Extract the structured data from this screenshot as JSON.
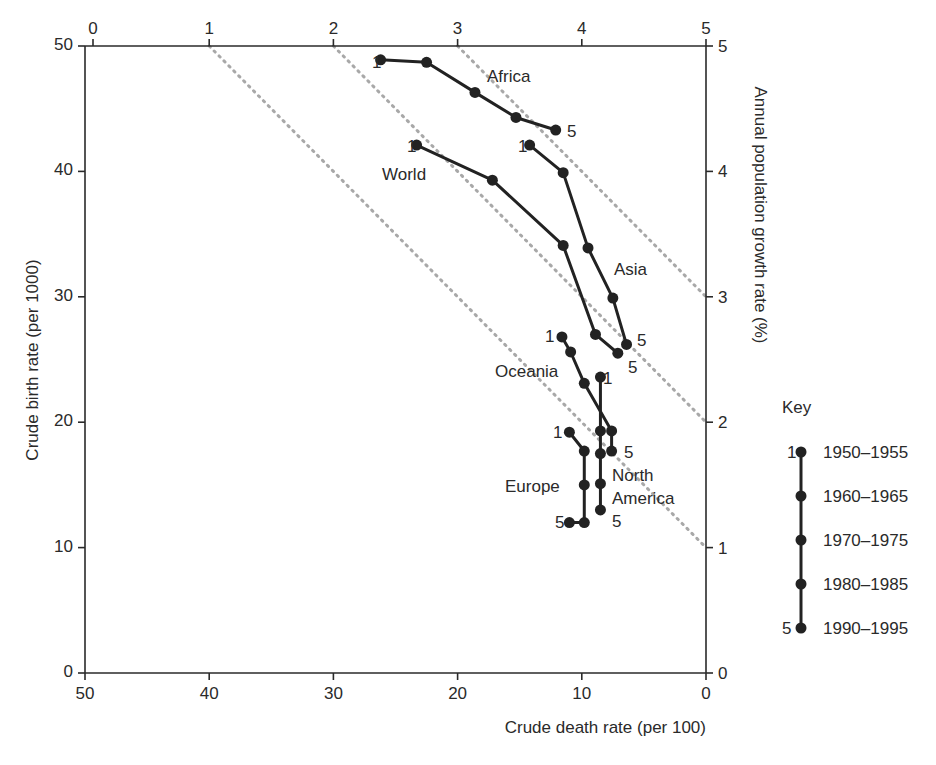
{
  "chart_data": {
    "type": "line",
    "title": "",
    "xlabel": "Crude death rate (per 100)",
    "ylabel": "Crude birth rate (per 1000)",
    "y2label": "Annual population growth rate (%)",
    "xlim": [
      50,
      0
    ],
    "ylim": [
      0,
      50
    ],
    "x_ticks": [
      "50",
      "40",
      "30",
      "20",
      "10",
      "0"
    ],
    "y_ticks": [
      "0",
      "10",
      "20",
      "30",
      "40",
      "50"
    ],
    "top_ticks": [
      "0",
      "1",
      "2",
      "3",
      "4",
      "5"
    ],
    "right_ticks": [
      "0",
      "1",
      "2",
      "3",
      "4",
      "5"
    ],
    "isolines_growth_pct": [
      1,
      2,
      3
    ],
    "periods": [
      "1950–1955",
      "1960–1965",
      "1970–1975",
      "1980–1985",
      "1990–1995"
    ],
    "series": [
      {
        "name": "Africa",
        "points": [
          [
            26.2,
            48.9
          ],
          [
            22.5,
            48.7
          ],
          [
            18.6,
            46.3
          ],
          [
            15.3,
            44.3
          ],
          [
            12.1,
            43.3
          ]
        ]
      },
      {
        "name": "World",
        "points": [
          [
            23.3,
            42.1
          ],
          [
            17.2,
            39.3
          ],
          [
            11.5,
            34.1
          ],
          [
            8.9,
            27.0
          ],
          [
            7.1,
            25.5
          ]
        ]
      },
      {
        "name": "Asia",
        "points": [
          [
            14.2,
            42.1
          ],
          [
            11.5,
            39.9
          ],
          [
            9.5,
            33.9
          ],
          [
            7.5,
            29.9
          ],
          [
            6.4,
            26.2
          ]
        ]
      },
      {
        "name": "Oceania",
        "points": [
          [
            11.6,
            26.8
          ],
          [
            10.9,
            25.6
          ],
          [
            9.8,
            23.1
          ],
          [
            7.6,
            19.3
          ],
          [
            7.6,
            17.7
          ]
        ]
      },
      {
        "name": "North America",
        "points": [
          [
            8.5,
            23.6
          ],
          [
            8.5,
            19.3
          ],
          [
            8.5,
            17.5
          ],
          [
            8.5,
            15.1
          ],
          [
            8.5,
            13.0
          ]
        ]
      },
      {
        "name": "Europe",
        "points": [
          [
            11.0,
            19.2
          ],
          [
            9.8,
            17.7
          ],
          [
            9.8,
            15.0
          ],
          [
            9.8,
            12.0
          ],
          [
            11.0,
            12.0
          ]
        ]
      }
    ],
    "legend": {
      "title": "Key",
      "start_label": "1",
      "end_label": "5"
    },
    "grid": false
  },
  "labels": {
    "africa": "Africa",
    "world": "World",
    "asia": "Asia",
    "oceania": "Oceania",
    "europe": "Europe",
    "north": "North",
    "america": "America",
    "one": "1",
    "five": "5"
  }
}
